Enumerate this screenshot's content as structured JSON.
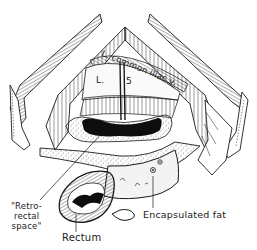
{
  "figure": {
    "type": "anatomical line illustration",
    "labels": {
      "common_iliac": "L. common iliac v.",
      "vertebra_L": "L.",
      "vertebra_5": "5",
      "retrorectal_line1": "\"Retro-",
      "retrorectal_line2": "rectal",
      "retrorectal_line3": "space\"",
      "rectum": "Rectum",
      "encapsulated_fat": "Encapsulated fat"
    },
    "colors": {
      "ink": "#1a1a1a",
      "background": "#ffffff",
      "cavity": "#0d0d0d",
      "fat_fill": "#eeeeee"
    }
  }
}
